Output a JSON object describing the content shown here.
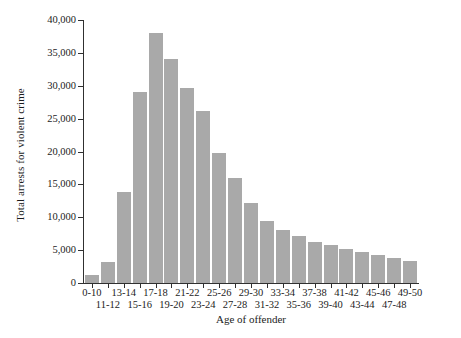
{
  "chart_data": {
    "type": "bar",
    "title": "",
    "xlabel": "Age of offender",
    "ylabel": "Total arrests for violent crime",
    "categories": [
      "0-10",
      "11-12",
      "13-14",
      "15-16",
      "17-18",
      "19-20",
      "21-22",
      "23-24",
      "25-26",
      "27-28",
      "29-30",
      "31-32",
      "33-34",
      "35-36",
      "37-38",
      "39-40",
      "41-42",
      "43-44",
      "45-46",
      "47-48",
      "49-50"
    ],
    "values": [
      1200,
      3200,
      13800,
      29000,
      38000,
      34000,
      29600,
      26200,
      19700,
      15900,
      12100,
      9500,
      8100,
      7100,
      6200,
      5800,
      5100,
      4700,
      4300,
      3800,
      3300
    ],
    "ylim": [
      0,
      40000
    ],
    "yticks": [
      0,
      5000,
      10000,
      15000,
      20000,
      25000,
      30000,
      35000,
      40000
    ],
    "ytick_labels": [
      "0",
      "5,000",
      "10,000",
      "15,000",
      "20,000",
      "25,000",
      "30,000",
      "35,000",
      "40,000"
    ],
    "grid": false,
    "legend": "none",
    "bar_color": "#a9a9a9",
    "axis_color": "#303030"
  }
}
